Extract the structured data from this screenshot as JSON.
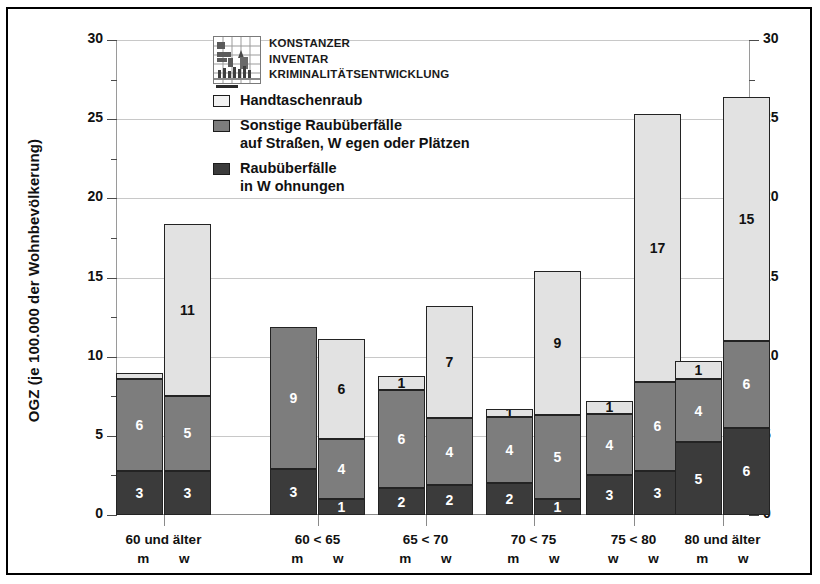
{
  "axis": {
    "y_label": "OGZ (je 100.000 der Wohnbevölkerung)",
    "ticks": [
      "0",
      "5",
      "10",
      "15",
      "20",
      "25",
      "30"
    ]
  },
  "legend": {
    "logo": {
      "line1": "KONSTANZER",
      "line2": "INVENTAR",
      "line3": "KRIMINALITÄTSENTWICKLUNG",
      "icon": "kik-grid-logo"
    },
    "entries": [
      {
        "key": "handtasche",
        "label_line1": "Handtaschenraub",
        "label_line2": "",
        "color": "#f2f2f2"
      },
      {
        "key": "sonstige",
        "label_line1": "Sonstige Raubüberfälle",
        "label_line2": "auf Straßen, W egen oder Plätzen",
        "color": "#7d7d7d"
      },
      {
        "key": "wohnung",
        "label_line1": "Raubüberfälle",
        "label_line2": "in W ohnungen",
        "color": "#3b3b3b"
      }
    ]
  },
  "chart_data": {
    "type": "bar",
    "stacked": true,
    "title": "",
    "xlabel": "",
    "ylabel": "OGZ (je 100.000 der Wohnbevölkerung)",
    "ylim": [
      0,
      30
    ],
    "ytick_step": 5,
    "yminor_step": 2.5,
    "grid": true,
    "legend_position": "inside-top-left",
    "series": [
      {
        "name": "Raubüberfälle in W ohnungen",
        "color": "#3b3b3b",
        "values": [
          2.8,
          2.8,
          2.9,
          1.0,
          1.7,
          1.9,
          2.0,
          1.0,
          2.5,
          2.8,
          4.6,
          5.5
        ]
      },
      {
        "name": "Sonstige Raubüberfälle auf Straßen, W egen oder Plätzen",
        "color": "#7d7d7d",
        "values": [
          5.8,
          4.7,
          9.0,
          3.8,
          6.2,
          4.2,
          4.2,
          5.3,
          3.9,
          5.6,
          4.0,
          5.5
        ]
      },
      {
        "name": "Handtaschenraub",
        "color": "#e2e2e2",
        "values": [
          0.4,
          10.9,
          0.0,
          6.3,
          0.9,
          7.1,
          0.5,
          9.1,
          0.8,
          16.9,
          1.1,
          15.4
        ]
      }
    ],
    "bars": [
      {
        "group": "60 und älter",
        "sex": "m",
        "wohnung": 2.8,
        "sonstige": 5.8,
        "handtasche": 0.4,
        "wohnung_label": "3",
        "sonstige_label": "6",
        "handtasche_label": "",
        "total": 9.0
      },
      {
        "group": "60 und älter",
        "sex": "w",
        "wohnung": 2.8,
        "sonstige": 4.7,
        "handtasche": 10.9,
        "wohnung_label": "3",
        "sonstige_label": "5",
        "handtasche_label": "11",
        "total": 18.4
      },
      {
        "group": "60 < 65",
        "sex": "m",
        "wohnung": 2.9,
        "sonstige": 9.0,
        "handtasche": 0.0,
        "wohnung_label": "3",
        "sonstige_label": "9",
        "handtasche_label": "",
        "total": 11.9
      },
      {
        "group": "60 < 65",
        "sex": "w",
        "wohnung": 1.0,
        "sonstige": 3.8,
        "handtasche": 6.3,
        "wohnung_label": "1",
        "sonstige_label": "4",
        "handtasche_label": "6",
        "total": 11.1
      },
      {
        "group": "65 < 70",
        "sex": "m",
        "wohnung": 1.7,
        "sonstige": 6.2,
        "handtasche": 0.9,
        "wohnung_label": "2",
        "sonstige_label": "6",
        "handtasche_label": "1",
        "total": 8.8
      },
      {
        "group": "65 < 70",
        "sex": "w",
        "wohnung": 1.9,
        "sonstige": 4.2,
        "handtasche": 7.1,
        "wohnung_label": "2",
        "sonstige_label": "4",
        "handtasche_label": "7",
        "total": 13.2
      },
      {
        "group": "70 < 75",
        "sex": "m",
        "wohnung": 2.0,
        "sonstige": 4.2,
        "handtasche": 0.5,
        "wohnung_label": "2",
        "sonstige_label": "4",
        "handtasche_label": "1",
        "total": 6.7
      },
      {
        "group": "70 < 75",
        "sex": "w",
        "wohnung": 1.0,
        "sonstige": 5.3,
        "handtasche": 9.1,
        "wohnung_label": "1",
        "sonstige_label": "5",
        "handtasche_label": "9",
        "total": 15.4
      },
      {
        "group": "75 < 80",
        "sex": "w",
        "wohnung": 2.5,
        "sonstige": 3.9,
        "handtasche": 0.8,
        "wohnung_label": "3",
        "sonstige_label": "4",
        "handtasche_label": "1",
        "total": 7.2
      },
      {
        "group": "75 < 80",
        "sex": "w",
        "wohnung": 2.8,
        "sonstige": 5.6,
        "handtasche": 16.9,
        "wohnung_label": "3",
        "sonstige_label": "6",
        "handtasche_label": "17",
        "total": 25.3
      },
      {
        "group": "80 und älter",
        "sex": "m",
        "wohnung": 4.6,
        "sonstige": 4.0,
        "handtasche": 1.1,
        "wohnung_label": "5",
        "sonstige_label": "4",
        "handtasche_label": "1",
        "total": 9.7
      },
      {
        "group": "80 und älter",
        "sex": "w",
        "wohnung": 5.5,
        "sonstige": 5.5,
        "handtasche": 15.4,
        "wohnung_label": "6",
        "sonstige_label": "6",
        "handtasche_label": "15",
        "total": 26.4
      }
    ],
    "groups": [
      {
        "range": "60 und älter",
        "sexes": "m  w"
      },
      {
        "range": "60 < 65",
        "sexes": "m  w"
      },
      {
        "range": "65 < 70",
        "sexes": "m  w"
      },
      {
        "range": "70 < 75",
        "sexes": "m  w"
      },
      {
        "range": "75 < 80",
        "sexes": "w  w"
      },
      {
        "range": "80 und älter",
        "sexes": "m  w"
      }
    ]
  }
}
